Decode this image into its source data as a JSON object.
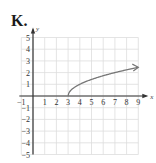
{
  "panel_label": "K.",
  "chart_data": {
    "type": "line",
    "title": "K.",
    "xlabel": "x",
    "ylabel": "y",
    "xlim": [
      -1,
      9
    ],
    "ylim": [
      -5,
      5
    ],
    "grid": true,
    "x_ticks": [
      -1,
      1,
      2,
      3,
      4,
      5,
      6,
      7,
      8,
      9
    ],
    "y_ticks": [
      5,
      4,
      3,
      2,
      1,
      -1,
      -2,
      -3,
      -4,
      -5
    ],
    "series": [
      {
        "name": "curve",
        "function": "y = sqrt(x - 3)",
        "start_point": [
          3,
          0
        ],
        "end_arrow": true,
        "x": [
          3,
          3.25,
          4,
          5,
          6,
          7,
          8,
          9
        ],
        "y": [
          0,
          0.5,
          1,
          1.41,
          1.73,
          2,
          2.24,
          2.45
        ]
      }
    ],
    "colors": {
      "curve": "#777777",
      "axes": "#333333",
      "grid": "#dddddd"
    }
  }
}
